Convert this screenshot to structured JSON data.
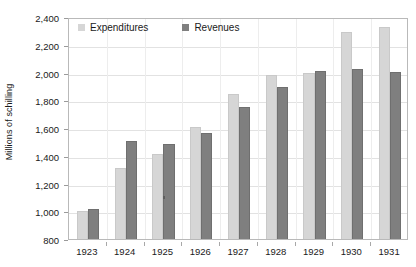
{
  "chart_data": {
    "type": "bar",
    "title": "",
    "xlabel": "",
    "ylabel": "Millions of schilling",
    "categories": [
      "1923",
      "1924",
      "1925",
      "1926",
      "1927",
      "1928",
      "1929",
      "1930",
      "1931"
    ],
    "series": [
      {
        "name": "Expenditures",
        "color": "#d6d6d6",
        "values": [
          1005,
          1315,
          1410,
          1605,
          1845,
          1980,
          2000,
          2290,
          2330
        ]
      },
      {
        "name": "Revenues",
        "color": "#7f7f7f",
        "values": [
          1015,
          1510,
          1485,
          1565,
          1750,
          1895,
          2010,
          2025,
          2005
        ]
      }
    ],
    "ylim": [
      800,
      2400
    ],
    "ytick_step": 200,
    "ytick_labels": [
      "2,400",
      "2,200",
      "2,000",
      "1,800",
      "1,600",
      "1,400",
      "1,200",
      "1,000",
      "800"
    ],
    "ytick_values": [
      2400,
      2200,
      2000,
      1800,
      1600,
      1400,
      1200,
      1000,
      800
    ],
    "grid": true,
    "legend_position": "top-left-inside",
    "plot_border_color": "#b9b9b9",
    "gridline_color": "#e2e2e2"
  }
}
